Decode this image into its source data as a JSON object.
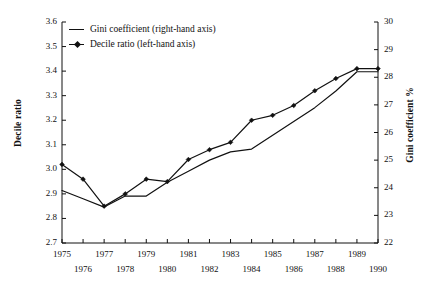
{
  "chart_data": {
    "type": "line",
    "title": "",
    "subtitle": "",
    "xlabel": "",
    "ylabel": "Decile ratio",
    "y2label": "Gini coefficient %",
    "xlim": [
      1975,
      1990
    ],
    "ylim": [
      2.7,
      3.6
    ],
    "y2lim": [
      22,
      30
    ],
    "grid": false,
    "legend_position": "top-left",
    "x": [
      1975,
      1976,
      1977,
      1978,
      1979,
      1980,
      1981,
      1982,
      1983,
      1984,
      1985,
      1986,
      1987,
      1988,
      1989,
      1990
    ],
    "xtick_labels_top": [
      "1975",
      "1977",
      "1979",
      "1981",
      "1983",
      "1985",
      "1987",
      "1989"
    ],
    "xtick_labels_bottom": [
      "1976",
      "1978",
      "1980",
      "1982",
      "1984",
      "1986",
      "1988",
      "1990"
    ],
    "ytick_labels_left": [
      "3.6",
      "3.5",
      "3.4",
      "3.3",
      "3.2",
      "3.1",
      "3.0",
      "2.9",
      "2.8",
      "2.7"
    ],
    "ytick_labels_right": [
      "30",
      "29",
      "28",
      "27",
      "26",
      "25",
      "24",
      "23",
      "22"
    ],
    "series": [
      {
        "name": "Decile ratio (left-hand axis)",
        "axis": "left",
        "marker": "diamond",
        "color": "#111111",
        "values": [
          3.02,
          2.96,
          2.85,
          2.9,
          2.96,
          2.95,
          3.04,
          3.08,
          3.11,
          3.2,
          3.22,
          3.26,
          3.32,
          3.37,
          3.41,
          3.41
        ]
      },
      {
        "name": "Gini coefficient (right-hand axis)",
        "axis": "right",
        "marker": "none",
        "color": "#111111",
        "values": [
          23.9,
          23.6,
          23.3,
          23.7,
          23.7,
          24.2,
          24.6,
          25.0,
          25.3,
          25.4,
          25.9,
          26.4,
          26.9,
          27.5,
          28.2,
          28.2
        ]
      }
    ]
  },
  "legend": {
    "items": [
      {
        "label": "Gini coefficient (right-hand axis)",
        "key": "line-key"
      },
      {
        "label": "Decile ratio (left-hand axis)",
        "key": "line-diamond-key"
      }
    ]
  },
  "axes": {
    "left_title": "Decile ratio",
    "right_title": "Gini coefficient %"
  }
}
